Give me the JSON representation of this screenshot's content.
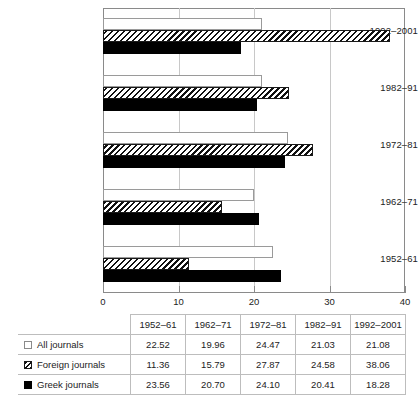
{
  "chart_data": {
    "type": "bar",
    "orientation": "horizontal",
    "title": "",
    "xlabel": "",
    "ylabel": "",
    "xlim": [
      0,
      40
    ],
    "xticks": [
      0,
      10,
      20,
      30,
      40
    ],
    "xtick_labels": [
      "0",
      "10",
      "20",
      "30",
      "40"
    ],
    "grid": true,
    "grid_axis": "x",
    "legend_position": "table-row-labels",
    "categories": [
      "1952–61",
      "1962–71",
      "1972–81",
      "1982–91",
      "1992–2001"
    ],
    "category_order_top_to_bottom": [
      "1992–2001",
      "1982–91",
      "1972–81",
      "1962–71",
      "1952–61"
    ],
    "series": [
      {
        "name": "All journals",
        "swatch": "white-square-outline",
        "values": [
          22.52,
          19.96,
          24.47,
          21.03,
          21.08
        ]
      },
      {
        "name": "Foreign journals",
        "swatch": "hatched-square",
        "values": [
          11.36,
          15.79,
          27.87,
          24.58,
          38.06
        ]
      },
      {
        "name": "Greek journals",
        "swatch": "black-square",
        "values": [
          23.56,
          20.7,
          24.1,
          20.41,
          18.28
        ]
      }
    ]
  },
  "table": {
    "corner_label": "",
    "headers": [
      "1952–61",
      "1962–71",
      "1972–81",
      "1982–91",
      "1992–2001"
    ],
    "rows": [
      {
        "label": "All journals",
        "swatch": "white-square-outline",
        "values": [
          "22.52",
          "19.96",
          "24.47",
          "21.03",
          "21.08"
        ]
      },
      {
        "label": "Foreign journals",
        "swatch": "hatched-square",
        "values": [
          "11.36",
          "15.79",
          "27.87",
          "24.58",
          "38.06"
        ]
      },
      {
        "label": "Greek journals",
        "swatch": "black-square",
        "values": [
          "23.56",
          "20.70",
          "24.10",
          "20.41",
          "18.28"
        ]
      }
    ]
  },
  "colors": {
    "axis": "#8a8a8a",
    "grid": "#c8c8c8",
    "bar_all": "#ffffff",
    "bar_greek": "#000000",
    "text": "#232323",
    "table_border": "#bdbdbd"
  }
}
